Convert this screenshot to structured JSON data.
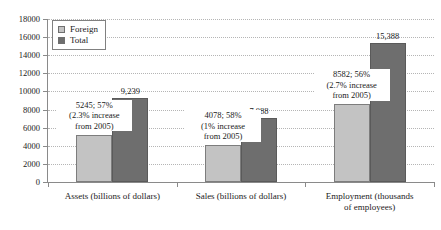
{
  "chart_data": {
    "type": "bar",
    "title": "",
    "subtitle": "",
    "xlabel": "",
    "ylabel": "",
    "ylim": [
      0,
      18000
    ],
    "ytick_interval": 2000,
    "yticks": [
      "0",
      "2000",
      "4000",
      "6000",
      "8000",
      "10000",
      "12000",
      "14000",
      "16000",
      "18000"
    ],
    "grid": true,
    "legend_position": "top-left",
    "categories": [
      "Assets (billions of dollars)",
      "Sales (billions of dollars)",
      "Employment (thousands of employees)"
    ],
    "series": [
      {
        "name": "Foreign",
        "color": "#c3c3c3",
        "values": [
          5245,
          4078,
          8582
        ]
      },
      {
        "name": "Total",
        "color": "#6e6e6e",
        "values": [
          9239,
          7088,
          15388
        ]
      }
    ],
    "value_labels": {
      "total": [
        "9,239",
        "7,088",
        "15,388"
      ]
    },
    "annotations": [
      {
        "line1": "5245; 57%",
        "line2": "(2.3% increase",
        "line3": "from 2005)"
      },
      {
        "line1": "4078; 58%",
        "line2": "(1% increase",
        "line3": "from 2005)"
      },
      {
        "line1": "8582; 56%",
        "line2": "(2.7% increase",
        "line3": "from 2005)"
      }
    ],
    "category_label_lines": [
      [
        "Assets (billions of dollars)"
      ],
      [
        "Sales (billions of dollars)"
      ],
      [
        "Employment (thousands",
        "of employees)"
      ]
    ]
  },
  "legend": {
    "items": [
      {
        "label": "Foreign"
      },
      {
        "label": "Total"
      }
    ]
  }
}
